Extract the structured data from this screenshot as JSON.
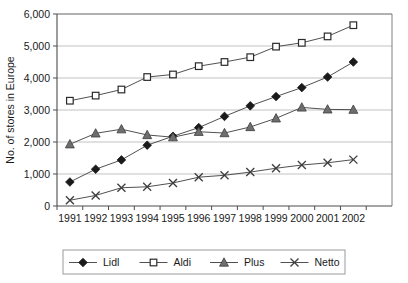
{
  "chart_data": {
    "type": "line",
    "title": "",
    "xlabel": "",
    "ylabel": "No. of stores in Europe",
    "x": [
      1991,
      1992,
      1993,
      1994,
      1995,
      1996,
      1997,
      1998,
      1999,
      2000,
      2001,
      2002
    ],
    "xtick_labels": [
      "1991",
      "1992",
      "1993",
      "1994",
      "1995",
      "1996",
      "1997",
      "1998",
      "1999",
      "2000",
      "2001",
      "2002"
    ],
    "ytick_labels": [
      "0",
      "1,000",
      "2,000",
      "3,000",
      "4,000",
      "5,000",
      "6,000"
    ],
    "yticks": [
      0,
      1000,
      2000,
      3000,
      4000,
      5000,
      6000
    ],
    "ylim": [
      0,
      6000
    ],
    "xlim": [
      1991,
      2003
    ],
    "grid": "horizontal",
    "legend_position": "bottom",
    "series": [
      {
        "name": "Lidl",
        "marker": "diamond",
        "color": "#1a1a1a",
        "values": [
          750,
          1150,
          1440,
          1900,
          2180,
          2450,
          2800,
          3130,
          3420,
          3700,
          4030,
          4500
        ]
      },
      {
        "name": "Aldi",
        "marker": "square",
        "color": "#ffffff",
        "values": [
          3290,
          3450,
          3640,
          4030,
          4110,
          4370,
          4500,
          4650,
          4980,
          5100,
          5300,
          5650
        ]
      },
      {
        "name": "Plus",
        "marker": "triangle",
        "color": "#6e6e6e",
        "values": [
          1930,
          2270,
          2400,
          2220,
          2150,
          2320,
          2280,
          2470,
          2740,
          3080,
          3020,
          3010
        ]
      },
      {
        "name": "Netto",
        "marker": "cross",
        "color": "#4d4d4d",
        "values": [
          180,
          330,
          570,
          600,
          720,
          900,
          960,
          1060,
          1180,
          1280,
          1350,
          1450
        ]
      }
    ]
  },
  "legend": {
    "items": [
      {
        "label": "Lidl",
        "marker": "diamond-marker-icon"
      },
      {
        "label": "Aldi",
        "marker": "square-marker-icon"
      },
      {
        "label": "Plus",
        "marker": "triangle-marker-icon"
      },
      {
        "label": "Netto",
        "marker": "cross-marker-icon"
      }
    ]
  }
}
